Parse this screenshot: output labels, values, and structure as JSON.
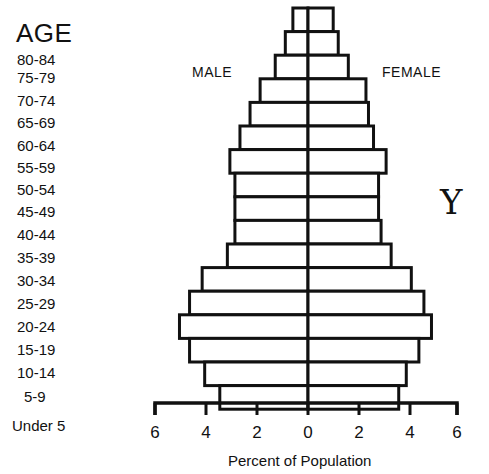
{
  "chart_data": {
    "type": "bar",
    "subtype": "population-pyramid",
    "title": "",
    "ylabel": "AGE",
    "xlabel": "Percent of Population",
    "categories": [
      "80-84",
      "75-79",
      "70-74",
      "65-69",
      "60-64",
      "55-59",
      "50-54",
      "45-49",
      "40-44",
      "35-39",
      "30-34",
      "25-29",
      "20-24",
      "15-19",
      "10-14",
      "5-9",
      "Under 5"
    ],
    "series": [
      {
        "name": "MALE",
        "side": "left",
        "values": [
          0.6,
          0.9,
          1.3,
          1.9,
          2.3,
          2.7,
          3.1,
          2.9,
          2.9,
          2.9,
          3.2,
          4.2,
          4.7,
          5.1,
          4.7,
          4.1,
          3.5
        ]
      },
      {
        "name": "FEMALE",
        "side": "right",
        "values": [
          1.0,
          1.2,
          1.6,
          2.3,
          2.4,
          2.6,
          3.1,
          2.8,
          2.8,
          2.9,
          3.3,
          4.1,
          4.6,
          4.9,
          4.4,
          3.9,
          3.6
        ]
      }
    ],
    "xticks": [
      "6",
      "4",
      "2",
      "0",
      "2",
      "4",
      "6"
    ],
    "xlim": [
      -6,
      6
    ],
    "grid": false,
    "legend": {
      "left_label": "MALE",
      "right_label": "FEMALE"
    },
    "annotation": "Y"
  },
  "labels": {
    "age_title": "AGE",
    "male": "MALE",
    "female": "FEMALE",
    "xlabel": "Percent of Population",
    "symbol": "Y"
  }
}
